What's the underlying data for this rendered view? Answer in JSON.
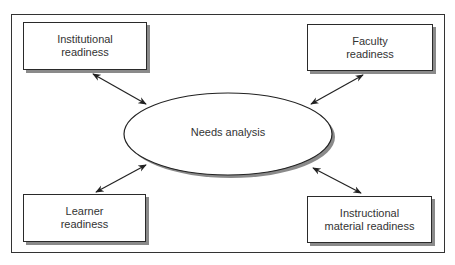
{
  "diagram": {
    "center": {
      "label": "Needs analysis"
    },
    "nodes": [
      {
        "id": "institutional",
        "line1": "Institutional",
        "line2": "readiness"
      },
      {
        "id": "faculty",
        "line1": "Faculty",
        "line2": "readiness"
      },
      {
        "id": "learner",
        "line1": "Learner",
        "line2": "readiness"
      },
      {
        "id": "instructional",
        "line1": "Instructional",
        "line2": "material readiness"
      }
    ],
    "edges": [
      {
        "from": "institutional",
        "to": "center",
        "type": "bidirectional"
      },
      {
        "from": "faculty",
        "to": "center",
        "type": "bidirectional"
      },
      {
        "from": "learner",
        "to": "center",
        "type": "bidirectional"
      },
      {
        "from": "instructional",
        "to": "center",
        "type": "bidirectional"
      }
    ],
    "colors": {
      "stroke": "#2a2a2a",
      "shadow": "#8a8a8a",
      "fill": "#ffffff"
    }
  }
}
